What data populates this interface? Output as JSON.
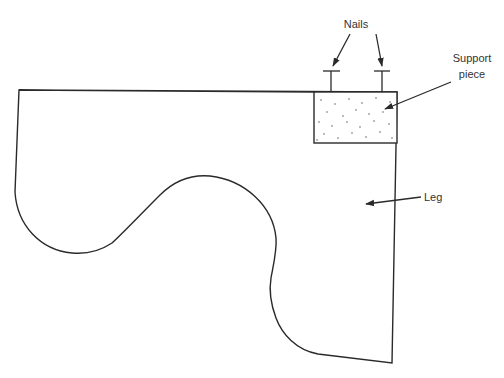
{
  "diagram": {
    "type": "labeled technical drawing",
    "labels": {
      "nails": "Nails",
      "support_line1": "Support",
      "support_line2": "piece",
      "leg": "Leg"
    },
    "parts": [
      {
        "id": "leg",
        "label": "Leg",
        "description": "curved leg outline"
      },
      {
        "id": "support-piece",
        "label": "Support piece",
        "description": "stippled rectangular block at top-right corner"
      },
      {
        "id": "nail-left",
        "label": "Nails",
        "description": "nail driven into support piece"
      },
      {
        "id": "nail-right",
        "label": "Nails",
        "description": "nail driven into support piece"
      }
    ],
    "colors": {
      "stroke": "#2a2a2a",
      "background": "#ffffff",
      "text": "#333333"
    }
  }
}
